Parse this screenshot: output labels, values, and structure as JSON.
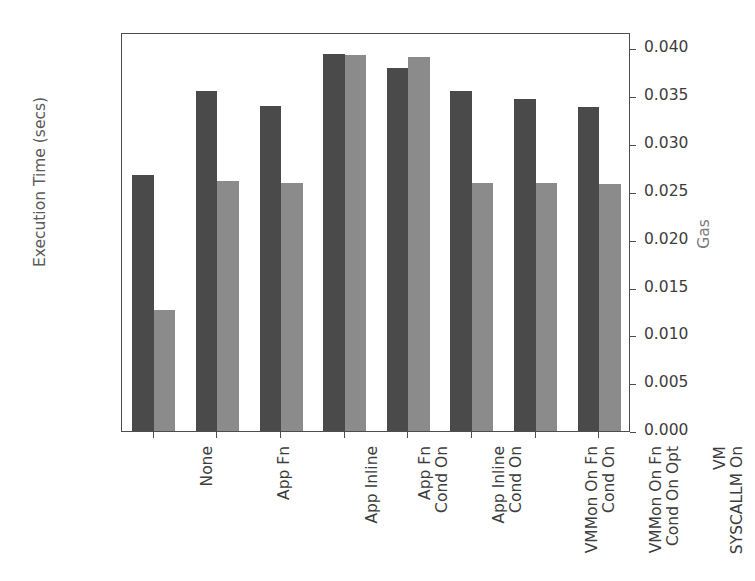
{
  "chart_data": {
    "type": "bar",
    "title": "",
    "categories": [
      "None",
      "App Fn",
      "App Inline",
      "App Fn\nCond On",
      "App Inline\nCond On",
      "VMMon On Fn\nCond On",
      "VMMon On Fn\nCond On Opt",
      "VM\nSYSCALLM On"
    ],
    "series": [
      {
        "name": "Execution Time (secs)",
        "axis": "left",
        "color": "#4a4a4a",
        "values": [
          0.0289,
          0.0384,
          0.0367,
          0.0425,
          0.041,
          0.0384,
          0.0374,
          0.0366
        ]
      },
      {
        "name": "Gas",
        "axis": "right",
        "color": "#8b8b8b",
        "values": [
          0.0126,
          0.0261,
          0.0259,
          0.0393,
          0.0391,
          0.0259,
          0.0259,
          0.0258
        ]
      }
    ],
    "ylabel": "Execution Time (secs)",
    "y2label": "Gas",
    "xlabel": "",
    "ylim": [
      0.0,
      0.045
    ],
    "y2lim": [
      0.0,
      0.0417
    ],
    "yticks": [
      "0.000",
      "0.005",
      "0.010",
      "0.015",
      "0.020",
      "0.025",
      "0.030",
      "0.035",
      "0.040",
      "0.045"
    ],
    "ytick_values": [
      0.0,
      0.005,
      0.01,
      0.015,
      0.02,
      0.025,
      0.03,
      0.035,
      0.04,
      0.045
    ],
    "y2ticks": [
      "0.000",
      "0.005",
      "0.010",
      "0.015",
      "0.020",
      "0.025",
      "0.030",
      "0.035",
      "0.040"
    ],
    "y2tick_values": [
      0.0,
      0.005,
      0.01,
      0.015,
      0.02,
      0.025,
      0.03,
      0.035,
      0.04
    ],
    "grid": false,
    "legend": null,
    "legend_position": "none"
  }
}
